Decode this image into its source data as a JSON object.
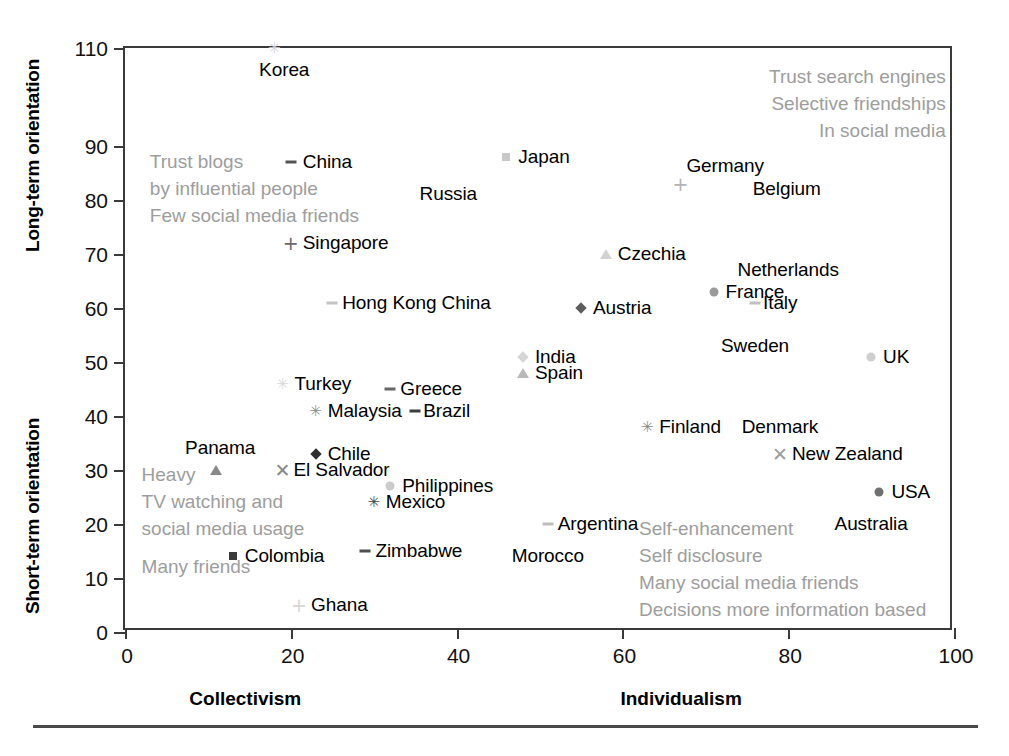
{
  "chart_data": {
    "type": "scatter",
    "title": "",
    "xlabel": "",
    "ylabel": "",
    "xlim": [
      0,
      100
    ],
    "ylim": [
      0,
      110
    ],
    "grid": false,
    "legend": "none",
    "x_axis": {
      "ticks": [
        0,
        20,
        40,
        60,
        80,
        100
      ],
      "tick_labels": [
        "0",
        "20",
        "40",
        "60",
        "80",
        "100"
      ],
      "low_end_label": "Collectivism",
      "high_end_label": "Individualism"
    },
    "y_axis": {
      "ticks": [
        0,
        10,
        20,
        30,
        40,
        50,
        60,
        70,
        80,
        90,
        110
      ],
      "tick_labels": [
        "0",
        "10",
        "20",
        "30",
        "40",
        "50",
        "60",
        "70",
        "80",
        "90",
        "110"
      ],
      "upper_half_label": "Long-term orientation",
      "lower_half_label": "Short-term orientation"
    },
    "points": [
      {
        "name": "Korea",
        "x": 18,
        "y": 110,
        "marker": "star",
        "marker_color": "#cfcfcf",
        "label_dx": 10,
        "label_dy": 22,
        "label_anchor": "center"
      },
      {
        "name": "China",
        "x": 20,
        "y": 87,
        "marker": "dash",
        "marker_color": "#555555",
        "label_dx": 12,
        "label_dy": 0,
        "label_anchor": "left"
      },
      {
        "name": "Japan",
        "x": 46,
        "y": 88,
        "marker": "square",
        "marker_color": "#c8c8c8",
        "label_dx": 12,
        "label_dy": 0,
        "label_anchor": "left"
      },
      {
        "name": "Germany",
        "x": 67,
        "y": 83,
        "marker": "plus",
        "marker_color": "#b5b5b5",
        "label_dx": 6,
        "label_dy": -18,
        "label_anchor": "left"
      },
      {
        "name": "Belgium",
        "x": 75,
        "y": 82,
        "marker": "none",
        "marker_color": "#d8d8d8",
        "label_dx": 6,
        "label_dy": 0,
        "label_anchor": "left"
      },
      {
        "name": "Russia",
        "x": 39,
        "y": 81,
        "marker": "none",
        "marker_color": "#cccccc",
        "label_dx": 0,
        "label_dy": 0,
        "label_anchor": "center"
      },
      {
        "name": "Singapore",
        "x": 20,
        "y": 72,
        "marker": "plus",
        "marker_color": "#6b6b6b",
        "label_dx": 12,
        "label_dy": 0,
        "label_anchor": "left"
      },
      {
        "name": "Czechia",
        "x": 58,
        "y": 70,
        "marker": "triangle",
        "marker_color": "#d2d2d2",
        "label_dx": 12,
        "label_dy": 0,
        "label_anchor": "left"
      },
      {
        "name": "Netherlands",
        "x": 80,
        "y": 67,
        "marker": "none",
        "marker_color": "#cccccc",
        "label_dx": 0,
        "label_dy": 0,
        "label_anchor": "center"
      },
      {
        "name": "France",
        "x": 71,
        "y": 63,
        "marker": "circle",
        "marker_color": "#9a9a9a",
        "label_dx": 12,
        "label_dy": 0,
        "label_anchor": "left"
      },
      {
        "name": "Hong Kong China",
        "x": 25,
        "y": 61,
        "marker": "dash",
        "marker_color": "#c4c4c4",
        "label_dx": 10,
        "label_dy": 0,
        "label_anchor": "left"
      },
      {
        "name": "Austria",
        "x": 55,
        "y": 60,
        "marker": "diamond",
        "marker_color": "#5d5d5d",
        "label_dx": 12,
        "label_dy": 0,
        "label_anchor": "left"
      },
      {
        "name": "Italy",
        "x": 76,
        "y": 61,
        "marker": "dash",
        "marker_color": "#c0c0c0",
        "label_dx": 8,
        "label_dy": 0,
        "label_anchor": "left"
      },
      {
        "name": "Sweden",
        "x": 76,
        "y": 53,
        "marker": "none",
        "marker_color": "#cccccc",
        "label_dx": 0,
        "label_dy": 0,
        "label_anchor": "center"
      },
      {
        "name": "India",
        "x": 48,
        "y": 51,
        "marker": "diamond",
        "marker_color": "#d5d5d5",
        "label_dx": 12,
        "label_dy": 0,
        "label_anchor": "left"
      },
      {
        "name": "UK",
        "x": 90,
        "y": 51,
        "marker": "circle",
        "marker_color": "#cfcfcf",
        "label_dx": 12,
        "label_dy": 0,
        "label_anchor": "left"
      },
      {
        "name": "Spain",
        "x": 48,
        "y": 48,
        "marker": "triangle",
        "marker_color": "#b9b9b9",
        "label_dx": 12,
        "label_dy": 0,
        "label_anchor": "left"
      },
      {
        "name": "Turkey",
        "x": 19,
        "y": 46,
        "marker": "star",
        "marker_color": "#d9d9d9",
        "label_dx": 12,
        "label_dy": 0,
        "label_anchor": "left"
      },
      {
        "name": "Greece",
        "x": 32,
        "y": 45,
        "marker": "dash",
        "marker_color": "#666666",
        "label_dx": 10,
        "label_dy": 0,
        "label_anchor": "left"
      },
      {
        "name": "Malaysia",
        "x": 23,
        "y": 41,
        "marker": "star",
        "marker_color": "#8f8f8f",
        "label_dx": 12,
        "label_dy": 0,
        "label_anchor": "left"
      },
      {
        "name": "Brazil",
        "x": 35,
        "y": 41,
        "marker": "dash",
        "marker_color": "#3d3d3d",
        "label_dx": 8,
        "label_dy": 0,
        "label_anchor": "left"
      },
      {
        "name": "Finland",
        "x": 63,
        "y": 38,
        "marker": "star",
        "marker_color": "#8c8c8c",
        "label_dx": 12,
        "label_dy": 0,
        "label_anchor": "left"
      },
      {
        "name": "Denmark",
        "x": 79,
        "y": 38,
        "marker": "none",
        "marker_color": "#cccccc",
        "label_dx": 0,
        "label_dy": 0,
        "label_anchor": "center"
      },
      {
        "name": "New Zealand",
        "x": 79,
        "y": 33,
        "marker": "ex",
        "marker_color": "#9d9d9d",
        "label_dx": 12,
        "label_dy": 0,
        "label_anchor": "left"
      },
      {
        "name": "Chile",
        "x": 23,
        "y": 33,
        "marker": "diamond",
        "marker_color": "#2e2e2e",
        "label_dx": 12,
        "label_dy": 0,
        "label_anchor": "left"
      },
      {
        "name": "Panama",
        "x": 11,
        "y": 30,
        "marker": "triangle",
        "marker_color": "#8a8a8a",
        "label_dx": 4,
        "label_dy": -22,
        "label_anchor": "center"
      },
      {
        "name": "El Salvador",
        "x": 19,
        "y": 30,
        "marker": "ex",
        "marker_color": "#8a8a8a",
        "label_dx": 11,
        "label_dy": 0,
        "label_anchor": "left"
      },
      {
        "name": "Philippines",
        "x": 32,
        "y": 27,
        "marker": "circle",
        "marker_color": "#cbcbcb",
        "label_dx": 12,
        "label_dy": 0,
        "label_anchor": "left"
      },
      {
        "name": "USA",
        "x": 91,
        "y": 26,
        "marker": "circle",
        "marker_color": "#6f6f6f",
        "label_dx": 12,
        "label_dy": 0,
        "label_anchor": "left"
      },
      {
        "name": "Mexico",
        "x": 30,
        "y": 24,
        "marker": "star",
        "marker_color": "#4a4a4a",
        "label_dx": 12,
        "label_dy": 0,
        "label_anchor": "left"
      },
      {
        "name": "Argentina",
        "x": 51,
        "y": 20,
        "marker": "dash",
        "marker_color": "#bdbdbd",
        "label_dx": 10,
        "label_dy": 0,
        "label_anchor": "left"
      },
      {
        "name": "Australia",
        "x": 90,
        "y": 20,
        "marker": "none",
        "marker_color": "#cccccc",
        "label_dx": 0,
        "label_dy": 0,
        "label_anchor": "center"
      },
      {
        "name": "Zimbabwe",
        "x": 29,
        "y": 15,
        "marker": "dash",
        "marker_color": "#4f4f4f",
        "label_dx": 10,
        "label_dy": 0,
        "label_anchor": "left"
      },
      {
        "name": "Morocco",
        "x": 51,
        "y": 14,
        "marker": "none",
        "marker_color": "#cccccc",
        "label_dx": 0,
        "label_dy": 0,
        "label_anchor": "center"
      },
      {
        "name": "Colombia",
        "x": 13,
        "y": 14,
        "marker": "square",
        "marker_color": "#3a3a3a",
        "label_dx": 12,
        "label_dy": 0,
        "label_anchor": "left"
      },
      {
        "name": "Ghana",
        "x": 21,
        "y": 5,
        "marker": "plus",
        "marker_color": "#d6d6d6",
        "label_dx": 12,
        "label_dy": 0,
        "label_anchor": "left"
      }
    ],
    "annotations": [
      {
        "id": "top-right",
        "x": 99,
        "y": 104,
        "align": "right",
        "color": "#9d9d9d",
        "lines": [
          "Trust search engines",
          "Selective friendships",
          "In social media"
        ]
      },
      {
        "id": "top-left",
        "x": 3,
        "y": 87,
        "align": "left",
        "color": "#9d9d9d",
        "lines": [
          "Trust blogs",
          "by influential people",
          "Few social media friends"
        ]
      },
      {
        "id": "bottom-left",
        "x": 2,
        "y": 29,
        "align": "left",
        "color": "#9d9d9d",
        "lines": [
          "Heavy",
          "TV watching and",
          "social media usage"
        ]
      },
      {
        "id": "many-friends",
        "x": 2,
        "y": 12,
        "align": "left",
        "color": "#9d9d9d",
        "lines": [
          "Many friends"
        ]
      },
      {
        "id": "bottom-right",
        "x": 62,
        "y": 19,
        "align": "left",
        "color": "#9d9d9d",
        "lines": [
          "Self-enhancement",
          "Self disclosure",
          "Many social media friends",
          "Decisions more information based"
        ]
      }
    ]
  },
  "caption": {
    "text": ""
  }
}
